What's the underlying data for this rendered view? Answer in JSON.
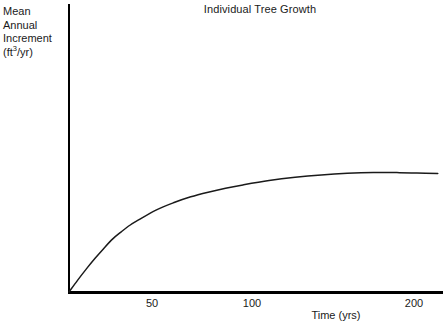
{
  "chart_data": {
    "type": "line",
    "title": "Individual Tree Growth",
    "xlabel": "Time (yrs)",
    "ylabel_lines": [
      "Mean",
      "Annual",
      "Increment",
      "(ft"
    ],
    "ylabel_sup": "3",
    "ylabel_tail": "/yr)",
    "ylabel_plain": "Mean Annual Increment (ft3/yr)",
    "xlim": [
      0,
      215
    ],
    "ylim": [
      0,
      1.15
    ],
    "grid": false,
    "legend": "none",
    "xticks": [
      {
        "value": 50,
        "label": "50",
        "px": 152
      },
      {
        "value": 100,
        "label": "100",
        "px": 252
      },
      {
        "value": 200,
        "label": "200",
        "px": 414
      }
    ],
    "yticks": [],
    "series": [
      {
        "name": "Mean Annual Increment",
        "color": "#1a1a1a",
        "x": [
          0,
          5,
          10,
          15,
          20,
          25,
          30,
          35,
          40,
          50,
          60,
          70,
          80,
          90,
          100,
          115,
          130,
          145,
          160,
          175,
          190,
          200,
          212
        ],
        "y": [
          0.0,
          0.09,
          0.175,
          0.255,
          0.33,
          0.4,
          0.455,
          0.505,
          0.545,
          0.62,
          0.675,
          0.72,
          0.755,
          0.785,
          0.81,
          0.843,
          0.868,
          0.886,
          0.898,
          0.904,
          0.903,
          0.9,
          0.896
        ]
      }
    ],
    "annotations": []
  },
  "figure": {
    "axis_color": "#000000",
    "background": "#ffffff",
    "text_color": "#1a1a1a"
  }
}
